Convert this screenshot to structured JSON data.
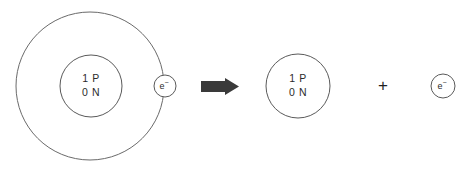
{
  "diagram": {
    "background_color": "#ffffff",
    "line_color": "#5a5a5a",
    "text_color": "#2b2b2b",
    "arrow_color": "#3a3a3a"
  },
  "reactant_atom": {
    "name": "hydrogen-atom",
    "orbit": {
      "cx": 90,
      "cy": 86,
      "r": 74
    },
    "nucleus": {
      "cx": 91,
      "cy": 86,
      "r": 31,
      "protons_label": "1 P",
      "neutrons_label": "0 N"
    },
    "electron": {
      "cx": 165,
      "cy": 86,
      "r": 11,
      "symbol": "e",
      "charge": "−"
    }
  },
  "arrow": {
    "name": "reaction-arrow",
    "label": "yields",
    "x": 201,
    "y": 78,
    "width": 38,
    "height": 17
  },
  "product_nucleus": {
    "name": "hydrogen-ion",
    "cx": 298,
    "cy": 86,
    "r": 32,
    "protons_label": "1 P",
    "neutrons_label": "0 N"
  },
  "plus": {
    "name": "plus-operator",
    "label": "+",
    "x": 383,
    "y": 87
  },
  "product_electron": {
    "name": "free-electron",
    "cx": 443,
    "cy": 86,
    "r": 12,
    "symbol": "e",
    "charge": "−"
  }
}
